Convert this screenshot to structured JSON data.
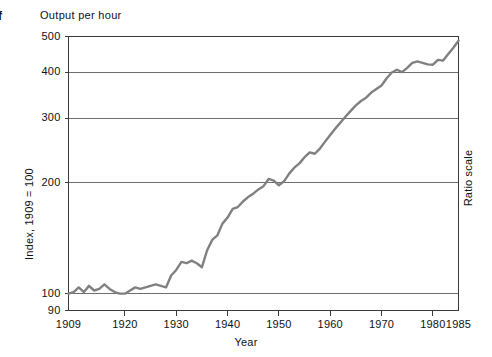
{
  "figure": {
    "margin_mark": "f",
    "plot_title": "Output per hour",
    "y_axis_title": "Index, 1909 = 100",
    "right_axis_title": "Ratio scale",
    "x_axis_title": "Year",
    "line_color": "#808080",
    "frame_color": "#3a3a3a",
    "grid_color": "#6e6e6e",
    "background": "#ffffff"
  },
  "chart_data": {
    "type": "line",
    "title": "Output per hour",
    "xlabel": "Year",
    "ylabel": "Index, 1909 = 100",
    "right_label": "Ratio scale",
    "yscale": "log",
    "grid": true,
    "legend": "none",
    "xlim": [
      1909,
      1985
    ],
    "ylim": [
      90,
      500
    ],
    "yticks": [
      90,
      100,
      200,
      300,
      400,
      500
    ],
    "ytick_labels": [
      "90",
      "100",
      "200",
      "300",
      "400",
      "500"
    ],
    "gridlines_drawn_at": [
      100,
      200,
      300,
      400,
      500
    ],
    "xticks": [
      1909,
      1920,
      1930,
      1940,
      1950,
      1960,
      1970,
      1980,
      1985
    ],
    "xtick_labels": [
      "1909",
      "1920",
      "1930",
      "1940",
      "1950",
      "1960",
      "1970",
      "1980",
      "1985"
    ],
    "series": [
      {
        "name": "Output per hour",
        "color": "#808080",
        "x": [
          1909,
          1910,
          1911,
          1912,
          1913,
          1914,
          1915,
          1916,
          1917,
          1918,
          1919,
          1920,
          1921,
          1922,
          1923,
          1924,
          1925,
          1926,
          1927,
          1928,
          1929,
          1930,
          1931,
          1932,
          1933,
          1934,
          1935,
          1936,
          1937,
          1938,
          1939,
          1940,
          1941,
          1942,
          1943,
          1944,
          1945,
          1946,
          1947,
          1948,
          1949,
          1950,
          1951,
          1952,
          1953,
          1954,
          1955,
          1956,
          1957,
          1958,
          1959,
          1960,
          1961,
          1962,
          1963,
          1964,
          1965,
          1966,
          1967,
          1968,
          1969,
          1970,
          1971,
          1972,
          1973,
          1974,
          1975,
          1976,
          1977,
          1978,
          1979,
          1980,
          1981,
          1982,
          1983,
          1984,
          1985
        ],
        "y": [
          100,
          101,
          104,
          101,
          105,
          102,
          103,
          106,
          103,
          101,
          100,
          100,
          102,
          104,
          103,
          104,
          105,
          106,
          105,
          104,
          112,
          116,
          122,
          121,
          123,
          121,
          118,
          131,
          140,
          144,
          155,
          161,
          170,
          172,
          178,
          183,
          187,
          192,
          196,
          205,
          203,
          197,
          202,
          212,
          220,
          226,
          235,
          242,
          240,
          248,
          259,
          270,
          281,
          292,
          303,
          314,
          325,
          334,
          341,
          352,
          360,
          368,
          385,
          399,
          406,
          400,
          411,
          424,
          428,
          424,
          420,
          419,
          432,
          430,
          448,
          466,
          487
        ]
      }
    ]
  }
}
